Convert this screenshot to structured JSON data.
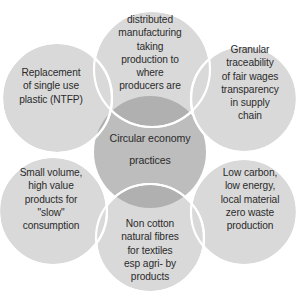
{
  "diagram": {
    "title": "Circular economy practices",
    "type": "venn-petal-diagram",
    "center": {
      "label": "Circular economy\npractices",
      "color": "#bfbfbf"
    },
    "petal_color": "#d9d9d9",
    "petal_stroke": "#ffffff",
    "text_color": "#2b2b2b",
    "background": "#ffffff",
    "petals": [
      {
        "id": "distributed-manufacturing",
        "position": "top",
        "label": "distributed\nmanufacturing\ntaking\nproduction to\nwhere\nproducers are"
      },
      {
        "id": "granular-traceability",
        "position": "right-top",
        "label": "Granular\ntraceability\nof fair wages\ntransparency\nin supply\nchain"
      },
      {
        "id": "low-carbon",
        "position": "right-bottom",
        "label": "Low carbon,\nlow energy,\nlocal material\nzero waste\nproduction"
      },
      {
        "id": "non-cotton-fibres",
        "position": "bottom",
        "label": "Non cotton\nnatural fibres\nfor  textiles\nesp agri- by\nproducts"
      },
      {
        "id": "small-volume",
        "position": "left-bottom",
        "label": "Small volume,\nhigh value\nproducts for\n\"slow\"\nconsumption"
      },
      {
        "id": "plastic-replacement",
        "position": "left-top",
        "label": "Replacement\nof single use\nplastic (NTFP)"
      }
    ]
  }
}
